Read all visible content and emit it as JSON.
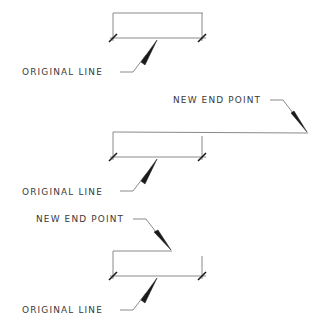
{
  "diagram": {
    "title": "",
    "colors": {
      "line": "#8a8a8a",
      "ink": "#1a1a1a",
      "text": "#3a3a3a"
    },
    "figures": [
      {
        "name": "figure-1-original",
        "labels": [
          {
            "id": "original",
            "text": "ORIGINAL LINE",
            "x": 22,
            "y": 67
          }
        ]
      },
      {
        "name": "figure-2-extended",
        "labels": [
          {
            "id": "new_end",
            "text": "NEW END POINT",
            "x": 173,
            "y": 95
          },
          {
            "id": "original",
            "text": "ORIGINAL LINE",
            "x": 22,
            "y": 187
          }
        ]
      },
      {
        "name": "figure-3-shortened",
        "labels": [
          {
            "id": "new_end",
            "text": "NEW END POINT",
            "x": 36,
            "y": 214
          },
          {
            "id": "original",
            "text": "ORIGINAL LINE",
            "x": 22,
            "y": 305
          }
        ]
      }
    ]
  }
}
